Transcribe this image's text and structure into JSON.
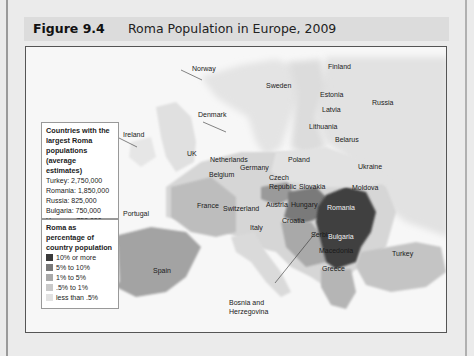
{
  "figure": {
    "number": "Figure 9.4",
    "title": "Roma Population in Europe, 2009"
  },
  "legend_largest": {
    "heading": "Countries with the largest Roma populations (average estimates)",
    "items": [
      {
        "country": "Turkey",
        "value": "2,750,000",
        "text": "Turkey: 2,750,000"
      },
      {
        "country": "Romania",
        "value": "1,850,000",
        "text": "Romania: 1,850,000"
      },
      {
        "country": "Russia",
        "value": "825,000",
        "text": "Russia: 825,000"
      },
      {
        "country": "Bulgaria",
        "value": "750,000",
        "text": "Bulgaria: 750,000"
      },
      {
        "country": "Hungary",
        "value": "750,000",
        "text": "Hungary: 750,000"
      }
    ]
  },
  "legend_percentage": {
    "heading": "Roma as percentage of country population",
    "items": [
      {
        "label": "10% or more",
        "color": "#3a3a3a"
      },
      {
        "label": "5% to 10%",
        "color": "#7a7a7a"
      },
      {
        "label": "1% to 5%",
        "color": "#a9a9a9"
      },
      {
        "label": ".5% to 1%",
        "color": "#c9c9c9"
      },
      {
        "label": "less than .5%",
        "color": "#e2e2e2"
      }
    ]
  },
  "map_labels": {
    "norway": "Norway",
    "finland": "Finland",
    "sweden": "Sweden",
    "estonia": "Estonia",
    "russia": "Russia",
    "latvia": "Latvia",
    "denmark": "Denmark",
    "ireland": "Ireland",
    "lithuania": "Lithuania",
    "belarus": "Belarus",
    "uk": "UK",
    "netherlands": "Netherlands",
    "poland": "Poland",
    "germany": "Germany",
    "ukraine": "Ukraine",
    "belgium": "Belgium",
    "czech": "Czech",
    "republic": "Republic",
    "slovakia": "Slovakia",
    "moldova": "Moldova",
    "portugal": "Portugal",
    "france": "France",
    "switzerland": "Switzerland",
    "austria": "Austria",
    "hungary": "Hungary",
    "romania": "Romania",
    "croatia": "Croatia",
    "italy": "Italy",
    "serbia": "Serbia",
    "bulgaria": "Bulgaria",
    "spain": "Spain",
    "macedonia": "Macedonia",
    "turkey": "Turkey",
    "greece": "Greece",
    "bosnia_1": "Bosnia and",
    "bosnia_2": "Herzegovina"
  }
}
